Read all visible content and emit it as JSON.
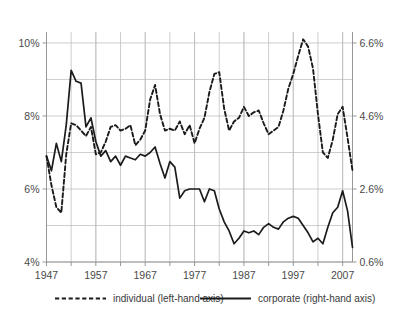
{
  "chart_data": {
    "type": "line",
    "title": "",
    "subtitle": "",
    "xlabel": "",
    "ylabel": "",
    "grid": true,
    "legend_position": "bottom",
    "x": [
      1947,
      1948,
      1949,
      1950,
      1951,
      1952,
      1953,
      1954,
      1955,
      1956,
      1957,
      1958,
      1959,
      1960,
      1961,
      1962,
      1963,
      1964,
      1965,
      1966,
      1967,
      1968,
      1969,
      1970,
      1971,
      1972,
      1973,
      1974,
      1975,
      1976,
      1977,
      1978,
      1979,
      1980,
      1981,
      1982,
      1983,
      1984,
      1985,
      1986,
      1987,
      1988,
      1989,
      1990,
      1991,
      1992,
      1993,
      1994,
      1995,
      1996,
      1997,
      1998,
      1999,
      2000,
      2001,
      2002,
      2003,
      2004,
      2005,
      2006,
      2007,
      2008,
      2009
    ],
    "xlim": [
      1947,
      2009
    ],
    "xticks": [
      1947,
      1957,
      1967,
      1977,
      1987,
      1997,
      2007
    ],
    "xtick_labels": [
      "1947",
      "1957",
      "1967",
      "1977",
      "1987",
      "1997",
      "2007"
    ],
    "left_axis": {
      "label": "individual (left-hand axis)",
      "ylim": [
        4,
        10.3
      ],
      "ticks": [
        4,
        6,
        8,
        10
      ],
      "tick_labels": [
        "4%",
        "6%",
        "8%",
        "10%"
      ],
      "minor_gridlines": [
        5,
        7,
        9
      ]
    },
    "right_axis": {
      "label": "corporate (right-hand axis)",
      "ylim": [
        0.6,
        6.9
      ],
      "ticks": [
        0.6,
        2.6,
        4.6,
        6.6
      ],
      "tick_labels": [
        "0.6%",
        "2.6%",
        "4.6%",
        "6.6%"
      ],
      "minor_gridlines": [
        1.6,
        3.6,
        5.6
      ]
    },
    "series": [
      {
        "name": "individual (left-hand axis)",
        "axis": "left",
        "style": "dashed",
        "color": "#1b1b1b",
        "unit": "%",
        "values": [
          6.9,
          6.1,
          5.5,
          5.35,
          6.95,
          7.8,
          7.75,
          7.6,
          7.45,
          7.7,
          6.95,
          7.0,
          7.3,
          7.7,
          7.75,
          7.6,
          7.65,
          7.75,
          7.2,
          7.35,
          7.6,
          8.45,
          8.85,
          8.05,
          7.6,
          7.65,
          7.6,
          7.85,
          7.5,
          7.75,
          7.25,
          7.65,
          7.95,
          8.65,
          9.15,
          9.2,
          8.2,
          7.6,
          7.85,
          7.95,
          8.25,
          8.0,
          8.1,
          8.15,
          7.8,
          7.5,
          7.6,
          7.7,
          8.15,
          8.75,
          9.15,
          9.65,
          10.1,
          9.9,
          9.3,
          8.05,
          7.0,
          6.85,
          7.35,
          8.05,
          8.25,
          7.4,
          6.5
        ]
      },
      {
        "name": "corporate (right-hand axis)",
        "axis": "right",
        "style": "solid",
        "color": "#1b1b1b",
        "unit": "%",
        "values": [
          3.5,
          3.1,
          3.85,
          3.35,
          4.35,
          5.85,
          5.55,
          5.5,
          4.3,
          4.55,
          3.9,
          3.5,
          3.65,
          3.35,
          3.5,
          3.25,
          3.5,
          3.45,
          3.4,
          3.55,
          3.5,
          3.6,
          3.75,
          3.3,
          2.9,
          3.35,
          3.2,
          2.35,
          2.55,
          2.6,
          2.6,
          2.6,
          2.25,
          2.6,
          2.55,
          2.05,
          1.7,
          1.45,
          1.1,
          1.25,
          1.45,
          1.4,
          1.45,
          1.35,
          1.55,
          1.65,
          1.55,
          1.5,
          1.7,
          1.8,
          1.85,
          1.8,
          1.6,
          1.4,
          1.15,
          1.25,
          1.1,
          1.55,
          1.95,
          2.1,
          2.55,
          2.0,
          1.0
        ]
      }
    ]
  },
  "legend": {
    "items": [
      {
        "label": "individual (left-hand axis)",
        "style": "dashed"
      },
      {
        "label": "corporate (right-hand axis)",
        "style": "solid"
      }
    ]
  }
}
